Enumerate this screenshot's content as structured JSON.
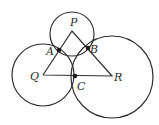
{
  "diagram": {
    "type": "geometry",
    "circles": [
      {
        "center": "P",
        "cx": 72,
        "cy": 34,
        "r": 22
      },
      {
        "center": "Q",
        "cx": 43,
        "cy": 75,
        "r": 31
      },
      {
        "center": "R",
        "cx": 112,
        "cy": 76,
        "r": 41
      }
    ],
    "triangle": {
      "vertices": [
        {
          "name": "P",
          "x": 72,
          "y": 31
        },
        {
          "name": "Q",
          "x": 43,
          "y": 75
        },
        {
          "name": "R",
          "x": 112,
          "y": 76
        }
      ]
    },
    "tangent_points": [
      {
        "name": "A",
        "x": 59,
        "y": 49
      },
      {
        "name": "B",
        "x": 88,
        "y": 48
      },
      {
        "name": "C",
        "x": 75,
        "y": 76
      }
    ],
    "labels": {
      "P": "P",
      "Q": "Q",
      "R": "R",
      "A": "A",
      "B": "B",
      "C": "C"
    }
  }
}
